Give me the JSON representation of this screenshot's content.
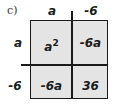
{
  "label": "c)",
  "columns": [
    "a",
    "-6"
  ],
  "rows": [
    "a",
    "-6"
  ],
  "cells": [
    [
      "a2",
      "-6a"
    ],
    [
      "-6a",
      "36"
    ]
  ],
  "cell_display": {
    "r0c0_base": "a",
    "r0c0_exp": "2",
    "r0c1": "-6a",
    "r1c0": "-6a",
    "r1c1": "36"
  },
  "colors": {
    "cell_fill": "#e4e4e4",
    "line": "#1a1a1a"
  }
}
